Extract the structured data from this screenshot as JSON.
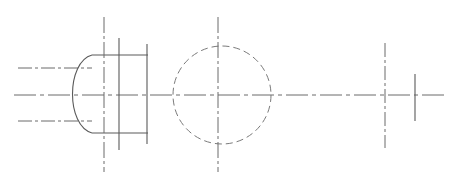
{
  "drawing": {
    "title": "Mechanical Part Sectional Drawing",
    "canvas": {
      "width": 467,
      "height": 189,
      "background": "#ffffff"
    },
    "styles": {
      "solid_color": "#5a5a5a",
      "centerline_color": "#6b6b6b",
      "hidden_color": "#7a7a7a",
      "solid_width": 1.1,
      "centerline_width": 1.0,
      "hidden_width": 1.0,
      "centerline_dash": "14,3,3,3",
      "hidden_dash": "7,4"
    },
    "elements": {
      "main_axis": {
        "label": "main horizontal centerline",
        "type": "centerline",
        "x1": 14,
        "y1": 95,
        "x2": 448,
        "y2": 95
      },
      "upper_datum": {
        "label": "upper horizontal centerline",
        "type": "centerline",
        "x1": 18,
        "y1": 68,
        "x2": 92,
        "y2": 68
      },
      "lower_datum": {
        "label": "lower horizontal centerline",
        "type": "centerline",
        "x1": 18,
        "y1": 121,
        "x2": 92,
        "y2": 121
      },
      "left_feature": {
        "label": "left slot feature",
        "arc": {
          "label": "semicircular end arc",
          "path": "M 92 55 C 66 62 66 126 92 133",
          "type": "solid"
        },
        "top_edge": {
          "type": "solid",
          "x1": 92,
          "y1": 55,
          "x2": 148,
          "y2": 55
        },
        "bottom_edge": {
          "type": "solid",
          "x1": 92,
          "y1": 133,
          "x2": 148,
          "y2": 133
        },
        "inner_vertical": {
          "type": "solid",
          "x1": 119,
          "y1": 38,
          "x2": 119,
          "y2": 150
        },
        "outer_vertical": {
          "type": "solid",
          "x1": 147,
          "y1": 44,
          "x2": 147,
          "y2": 144
        },
        "centerline_vertical": {
          "type": "centerline",
          "x1": 104,
          "y1": 17,
          "x2": 104,
          "y2": 172
        }
      },
      "center_feature": {
        "label": "center hidden circle",
        "circle": {
          "label": "hidden bore circle",
          "cx": 222,
          "cy": 95,
          "r": 49,
          "type": "hidden"
        },
        "centerline_vertical": {
          "type": "centerline",
          "x1": 218,
          "y1": 17,
          "x2": 218,
          "y2": 172
        }
      },
      "right_feature": {
        "label": "right shaft feature",
        "centerline_vertical": {
          "type": "centerline",
          "x1": 385,
          "y1": 43,
          "x2": 385,
          "y2": 148
        },
        "solid_vertical": {
          "type": "solid",
          "x1": 415,
          "y1": 74,
          "x2": 415,
          "y2": 121
        }
      }
    }
  }
}
